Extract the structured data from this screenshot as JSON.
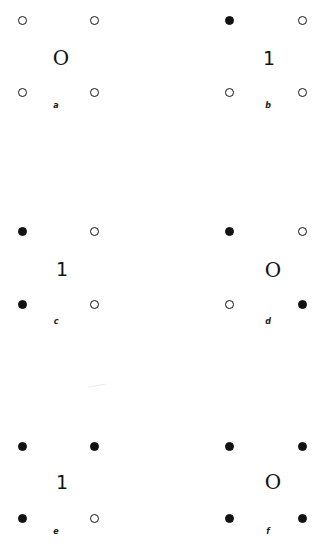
{
  "figure": {
    "background_color": "#ffffff",
    "marker_color": "#121212",
    "columns": 2,
    "rows": 3,
    "panels": [
      {
        "id": "a",
        "label": "a",
        "center_glyph": "O",
        "glyph_kind": "letter",
        "nodes": [
          {
            "position": "top-left",
            "state": "open"
          },
          {
            "position": "top-right",
            "state": "open"
          },
          {
            "position": "bottom-left",
            "state": "open"
          },
          {
            "position": "bottom-right",
            "state": "open"
          }
        ]
      },
      {
        "id": "b",
        "label": "b",
        "center_glyph": "1",
        "glyph_kind": "digit",
        "nodes": [
          {
            "position": "top-left",
            "state": "filled"
          },
          {
            "position": "top-right",
            "state": "open"
          },
          {
            "position": "bottom-left",
            "state": "open"
          },
          {
            "position": "bottom-right",
            "state": "open"
          }
        ]
      },
      {
        "id": "c",
        "label": "c",
        "center_glyph": "1",
        "glyph_kind": "digit",
        "nodes": [
          {
            "position": "top-left",
            "state": "filled"
          },
          {
            "position": "top-right",
            "state": "open"
          },
          {
            "position": "bottom-left",
            "state": "filled"
          },
          {
            "position": "bottom-right",
            "state": "open"
          }
        ]
      },
      {
        "id": "d",
        "label": "d",
        "center_glyph": "O",
        "glyph_kind": "letter",
        "nodes": [
          {
            "position": "top-left",
            "state": "filled"
          },
          {
            "position": "top-right",
            "state": "open"
          },
          {
            "position": "bottom-left",
            "state": "open"
          },
          {
            "position": "bottom-right",
            "state": "filled"
          }
        ]
      },
      {
        "id": "e",
        "label": "e",
        "center_glyph": "1",
        "glyph_kind": "digit",
        "nodes": [
          {
            "position": "top-left",
            "state": "filled"
          },
          {
            "position": "top-right",
            "state": "filled"
          },
          {
            "position": "bottom-left",
            "state": "filled"
          },
          {
            "position": "bottom-right",
            "state": "open"
          }
        ]
      },
      {
        "id": "f",
        "label": "f",
        "center_glyph": "O",
        "glyph_kind": "letter",
        "nodes": [
          {
            "position": "top-left",
            "state": "filled"
          },
          {
            "position": "top-right",
            "state": "filled"
          },
          {
            "position": "bottom-left",
            "state": "filled"
          },
          {
            "position": "bottom-right",
            "state": "filled"
          }
        ]
      }
    ]
  }
}
